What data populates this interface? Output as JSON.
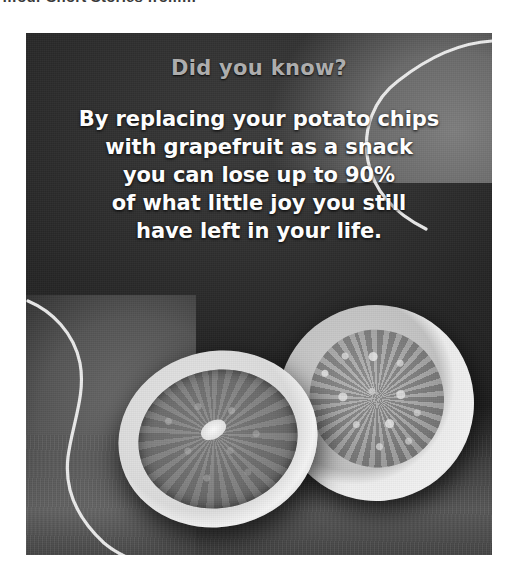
{
  "page": {
    "header_text_clipped": "…our Short Stories from…",
    "background_color": "#ffffff"
  },
  "meme": {
    "headline": "Did you know?",
    "headline_color": "#adadad",
    "body_color": "#fdfdfd",
    "body_lines": [
      "By replacing your potato chips",
      "with grapefruit as a snack",
      "you can lose up to 90%",
      "of what little joy you still",
      "have left in your life."
    ],
    "photo": {
      "subject": "two grapefruit halves on a dark table",
      "treatment": "grayscale / desaturated print scan",
      "background_color": "#242424"
    }
  }
}
